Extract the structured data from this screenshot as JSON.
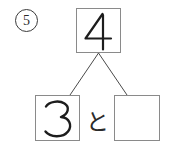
{
  "worksheet": {
    "problem_number": "5",
    "problem_number_style": "circled",
    "ink_color": "#1d1d1d",
    "box_border_color": "#8a8a8a",
    "connector_color": "#4a4a4a",
    "background_color": "#ffffff"
  },
  "number_bond": {
    "whole": {
      "label": "whole-box",
      "value": "4",
      "filled": true
    },
    "parts": [
      {
        "label": "part-box-left",
        "value": "3",
        "filled": true
      },
      {
        "label": "part-box-right",
        "value": "",
        "filled": false
      }
    ],
    "conjunction": "と"
  }
}
